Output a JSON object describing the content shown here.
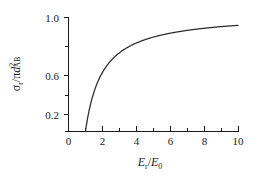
{
  "chart_data": {
    "type": "line",
    "title": "",
    "xlabel": "E_r / E_0",
    "ylabel": "sigma_r / pi d_AB^2",
    "xlim": [
      0,
      10
    ],
    "ylim": [
      0,
      1.1
    ],
    "grid": false,
    "legend": "none",
    "x_ticks_major": [
      0,
      2,
      4,
      6,
      8,
      10
    ],
    "x_tick_labels": [
      "0",
      "2",
      "4",
      "6",
      "8",
      "10"
    ],
    "x_ticks_minor": [
      1,
      3,
      5,
      7,
      9
    ],
    "y_ticks_major": [
      0.2,
      0.6,
      1.0
    ],
    "y_tick_labels": [
      "0.2",
      "0.6",
      "1.0"
    ],
    "y_ticks_minor": [
      0.4,
      0.8
    ],
    "series": [
      {
        "name": "reactive cross section",
        "equation": "1 - E_0/E_r",
        "threshold": 1.0,
        "x": [
          1.0,
          1.05,
          1.1,
          1.2,
          1.3,
          1.4,
          1.5,
          1.6,
          1.8,
          2.0,
          2.25,
          2.5,
          2.75,
          3.0,
          3.5,
          4.0,
          4.5,
          5.0,
          5.5,
          6.0,
          6.5,
          7.0,
          7.5,
          8.0,
          8.5,
          9.0,
          9.5,
          10.0
        ],
        "y": [
          0.0,
          0.048,
          0.091,
          0.167,
          0.231,
          0.286,
          0.333,
          0.375,
          0.444,
          0.5,
          0.556,
          0.6,
          0.636,
          0.667,
          0.714,
          0.75,
          0.778,
          0.8,
          0.818,
          0.833,
          0.846,
          0.857,
          0.867,
          0.875,
          0.882,
          0.889,
          0.895,
          0.9
        ]
      }
    ]
  },
  "labels": {
    "x_axis": {
      "symbol_main": "E",
      "symbol_main_sub": "r",
      "slash": "/",
      "symbol_ref": "E",
      "symbol_ref_sub": "0"
    },
    "y_axis": {
      "sigma": "σ",
      "sigma_sub": "r",
      "slash": "/",
      "pi": "π",
      "d": "d",
      "d_sup": "2",
      "d_sub": "AB"
    }
  },
  "style": {
    "curve_color": "#2a2a2a",
    "axis_color": "#1a1a1a",
    "background": "#ffffff"
  }
}
